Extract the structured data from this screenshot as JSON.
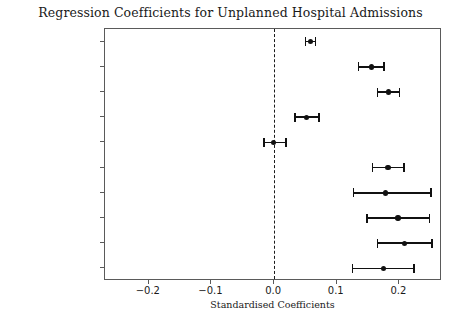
{
  "chart_data": {
    "type": "scatter",
    "title": "Regression Coefficients for Unplanned Hospital Admissions",
    "subtitle": "",
    "xlabel": "Standardised Coefficients",
    "ylabel": "",
    "xlim": [
      -0.27,
      0.268
    ],
    "xticks": [
      -0.2,
      -0.1,
      0.0,
      0.1,
      0.2
    ],
    "xticklabels": [
      "−0.2",
      "−0.1",
      "0.0",
      "0.1",
      "0.2"
    ],
    "grid": false,
    "legend": null,
    "reference_line": {
      "x": 0.0,
      "style": "dashed",
      "color": "#1a1a1a"
    },
    "marker_color": "#111111",
    "categories": [
      "Age",
      "Smoker",
      "No Smoking Status",
      "Ex Smoker",
      "Female",
      "Delay: > 12 Months",
      "Delay: 3-6 Months",
      "Delay: 1-3 Months",
      "Delay: 6-12 Months",
      "Delay: 0-1 Month"
    ],
    "values": [
      0.058,
      0.155,
      0.183,
      0.052,
      -0.001,
      0.182,
      0.178,
      0.198,
      0.208,
      0.175
    ],
    "ci_low": [
      0.05,
      0.135,
      0.165,
      0.033,
      -0.016,
      0.157,
      0.127,
      0.148,
      0.165,
      0.125
    ],
    "ci_high": [
      0.066,
      0.175,
      0.2,
      0.072,
      0.019,
      0.207,
      0.25,
      0.248,
      0.252,
      0.223
    ]
  }
}
